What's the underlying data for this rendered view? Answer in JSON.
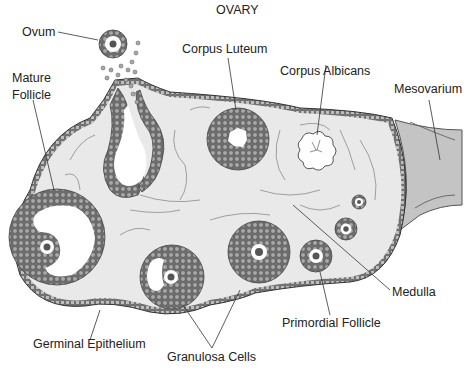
{
  "title": "OVARY",
  "labels": {
    "ovum": "Ovum",
    "mature_follicle_line1": "Mature",
    "mature_follicle_line2": "Follicle",
    "corpus_luteum": "Corpus Luteum",
    "corpus_albicans": "Corpus Albicans",
    "mesovarium": "Mesovarium",
    "medulla": "Medulla",
    "primordial_follicle": "Primordial Follicle",
    "germinal_epithelium": "Germinal Epithelium",
    "granulosa_cells": "Granulosa Cells"
  },
  "colors": {
    "stroma": "#e9e9e9",
    "cells": "#8f8f8f",
    "cell_edge": "#555555",
    "mesovarium": "#c4c4c4",
    "nucleus": "#555555",
    "line": "#333333"
  }
}
